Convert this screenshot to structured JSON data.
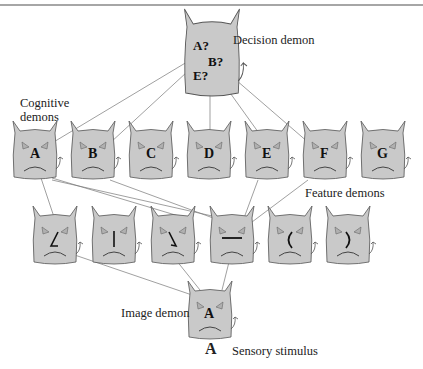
{
  "colors": {
    "demon_fill": "#c9c9c9",
    "demon_stroke": "#555555",
    "line": "#777777",
    "border": "#888888"
  },
  "labels": {
    "decision": "Decision demon",
    "cognitive": "Cognitive",
    "cognitive2": "demons",
    "feature": "Feature demons",
    "image": "Image demon",
    "stimulus_letter": "A",
    "stimulus": "Sensory stimulus"
  },
  "decision_demon": {
    "lines": [
      "A?",
      "B?",
      "E?"
    ]
  },
  "cognitive_demons": [
    "A",
    "B",
    "C",
    "D",
    "E",
    "F",
    "G"
  ],
  "feature_demons": [
    "slanted-line-left",
    "vertical-line",
    "slanted-line-right",
    "horizontal-line",
    "left-curve",
    "right-curve"
  ],
  "image_demon": {
    "letter": "A"
  }
}
